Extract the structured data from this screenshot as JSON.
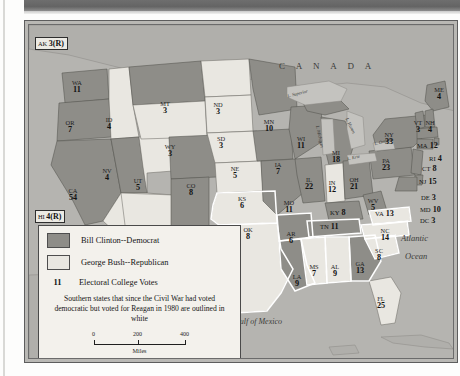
{
  "map": {
    "title": "1992 Presidential Election Electoral College Map",
    "countries": [
      {
        "name": "CANADA",
        "x": 250,
        "y": 38
      },
      {
        "name": "MEXICO",
        "x": 100,
        "y": 300
      }
    ],
    "waters": [
      {
        "name": "Atlantic",
        "x": 378,
        "y": 215
      },
      {
        "name": "Ocean",
        "x": 382,
        "y": 231
      },
      {
        "name": "Gulf of Mexico",
        "x": 238,
        "y": 295
      }
    ],
    "lakes": [
      {
        "name": "L. Superior",
        "x": 281,
        "y": 80
      },
      {
        "name": "L. Michigan",
        "x": 293,
        "y": 118
      },
      {
        "name": "L. Huron",
        "x": 320,
        "y": 108
      },
      {
        "name": "L. Erie",
        "x": 322,
        "y": 139
      },
      {
        "name": "L. Ontario",
        "x": 348,
        "y": 127
      }
    ],
    "insets": [
      {
        "abbr": "AK",
        "votes": "3(R)",
        "x": 10,
        "y": 33
      },
      {
        "abbr": "HI",
        "votes": "4(R)",
        "x": 10,
        "y": 206
      }
    ],
    "states": [
      {
        "abbr": "WA",
        "votes": "11",
        "party": "D",
        "x": 48,
        "y": 60,
        "layout": "stack"
      },
      {
        "abbr": "OR",
        "votes": "7",
        "party": "D",
        "x": 41,
        "y": 100,
        "layout": "stack"
      },
      {
        "abbr": "CA",
        "votes": "54",
        "party": "D",
        "x": 44,
        "y": 168,
        "layout": "stack"
      },
      {
        "abbr": "ID",
        "votes": "4",
        "party": "R",
        "x": 80,
        "y": 97,
        "layout": "stack"
      },
      {
        "abbr": "NV",
        "votes": "4",
        "party": "D",
        "x": 78,
        "y": 148,
        "layout": "stack"
      },
      {
        "abbr": "UT",
        "votes": "5",
        "party": "R",
        "x": 109,
        "y": 158,
        "layout": "stack"
      },
      {
        "abbr": "AZ",
        "votes": "8",
        "party": "R",
        "x": 108,
        "y": 206,
        "layout": "stack"
      },
      {
        "abbr": "MT",
        "votes": "3",
        "party": "D",
        "x": 136,
        "y": 81,
        "layout": "stack"
      },
      {
        "abbr": "WY",
        "votes": "3",
        "party": "R",
        "x": 141,
        "y": 124,
        "layout": "stack"
      },
      {
        "abbr": "CO",
        "votes": "8",
        "party": "D",
        "x": 162,
        "y": 163,
        "layout": "stack"
      },
      {
        "abbr": "NM",
        "votes": "5",
        "party": "D",
        "x": 155,
        "y": 209,
        "layout": "stack"
      },
      {
        "abbr": "ND",
        "votes": "3",
        "party": "R",
        "x": 189,
        "y": 82,
        "layout": "stack"
      },
      {
        "abbr": "SD",
        "votes": "3",
        "party": "R",
        "x": 192,
        "y": 116,
        "layout": "stack"
      },
      {
        "abbr": "NE",
        "votes": "5",
        "party": "R",
        "x": 206,
        "y": 146,
        "layout": "stack"
      },
      {
        "abbr": "KS",
        "votes": "6",
        "party": "R",
        "x": 213,
        "y": 176,
        "layout": "stack"
      },
      {
        "abbr": "OK",
        "votes": "8",
        "party": "R",
        "x": 219,
        "y": 207,
        "layout": "stack"
      },
      {
        "abbr": "TX",
        "votes": "32",
        "party": "R",
        "x": 207,
        "y": 246,
        "layout": "stack"
      },
      {
        "abbr": "MN",
        "votes": "10",
        "party": "D",
        "x": 240,
        "y": 99,
        "layout": "stack"
      },
      {
        "abbr": "IA",
        "votes": "7",
        "party": "D",
        "x": 249,
        "y": 142,
        "layout": "stack"
      },
      {
        "abbr": "MO",
        "votes": "11",
        "party": "D",
        "x": 260,
        "y": 180,
        "layout": "stack"
      },
      {
        "abbr": "AR",
        "votes": "6",
        "party": "D",
        "x": 262,
        "y": 211,
        "layout": "stack"
      },
      {
        "abbr": "LA",
        "votes": "9",
        "party": "D",
        "x": 268,
        "y": 254,
        "layout": "stack"
      },
      {
        "abbr": "MS",
        "votes": "7",
        "party": "R",
        "x": 285,
        "y": 244,
        "layout": "stack"
      },
      {
        "abbr": "AL",
        "votes": "9",
        "party": "R",
        "x": 306,
        "y": 244,
        "layout": "stack"
      },
      {
        "abbr": "GA",
        "votes": "13",
        "party": "D",
        "x": 331,
        "y": 241,
        "layout": "stack"
      },
      {
        "abbr": "FL",
        "votes": "25",
        "party": "R",
        "x": 352,
        "y": 276,
        "layout": "stack"
      },
      {
        "abbr": "WI",
        "votes": "11",
        "party": "D",
        "x": 272,
        "y": 116,
        "layout": "stack"
      },
      {
        "abbr": "IL",
        "votes": "22",
        "party": "D",
        "x": 280,
        "y": 157,
        "layout": "stack"
      },
      {
        "abbr": "MI",
        "votes": "18",
        "party": "D",
        "x": 307,
        "y": 130,
        "layout": "stack"
      },
      {
        "abbr": "IN",
        "votes": "12",
        "party": "R",
        "x": 303,
        "y": 160,
        "layout": "stack"
      },
      {
        "abbr": "OH",
        "votes": "21",
        "party": "D",
        "x": 325,
        "y": 157,
        "layout": "stack"
      },
      {
        "abbr": "KY",
        "votes": "8",
        "party": "D",
        "x": 313,
        "y": 187,
        "layout": "inline"
      },
      {
        "abbr": "TN",
        "votes": "11",
        "party": "D",
        "x": 303,
        "y": 201,
        "layout": "inline"
      },
      {
        "abbr": "WV",
        "votes": "5",
        "party": "D",
        "x": 344,
        "y": 178,
        "layout": "stack"
      },
      {
        "abbr": "VA",
        "votes": "13",
        "party": "R",
        "x": 358,
        "y": 188,
        "layout": "inline"
      },
      {
        "abbr": "NC",
        "votes": "14",
        "party": "R",
        "x": 356,
        "y": 208,
        "layout": "stack"
      },
      {
        "abbr": "SC",
        "votes": "8",
        "party": "R",
        "x": 350,
        "y": 228,
        "layout": "stack"
      },
      {
        "abbr": "PA",
        "votes": "23",
        "party": "D",
        "x": 357,
        "y": 138,
        "layout": "stack"
      },
      {
        "abbr": "NY",
        "votes": "33",
        "party": "D",
        "x": 360,
        "y": 112,
        "layout": "stack"
      },
      {
        "abbr": "ME",
        "votes": "4",
        "party": "D",
        "x": 410,
        "y": 67,
        "layout": "stack"
      },
      {
        "abbr": "VT",
        "votes": "3",
        "party": "D",
        "x": 389,
        "y": 100,
        "layout": "stack"
      },
      {
        "abbr": "NH",
        "votes": "4",
        "party": "D",
        "x": 401,
        "y": 100,
        "layout": "stack"
      },
      {
        "abbr": "MA",
        "votes": "12",
        "party": "D",
        "x": 400,
        "y": 120,
        "layout": "inline"
      },
      {
        "abbr": "RI",
        "votes": "4",
        "party": "D",
        "x": 412,
        "y": 133,
        "layout": "inline"
      },
      {
        "abbr": "CT",
        "votes": "8",
        "party": "D",
        "x": 405,
        "y": 143,
        "layout": "inline"
      },
      {
        "abbr": "NJ",
        "votes": "15",
        "party": "D",
        "x": 402,
        "y": 156,
        "layout": "inline"
      },
      {
        "abbr": "DE",
        "votes": "3",
        "party": "D",
        "x": 404,
        "y": 172,
        "layout": "inline"
      },
      {
        "abbr": "MD",
        "votes": "10",
        "party": "D",
        "x": 403,
        "y": 184,
        "layout": "inline"
      },
      {
        "abbr": "DC",
        "votes": "3",
        "party": "D",
        "x": 403,
        "y": 195,
        "layout": "inline"
      }
    ]
  },
  "legend": {
    "democrat_label": "Bill Clinton--Democrat",
    "republican_label": "George Bush--Republican",
    "votes_sample": "11",
    "votes_label": "Electoral College Votes",
    "note": "Southern states that since the Civil War had voted democratic but voted for Reagan in 1980 are outlined in white",
    "colors": {
      "democrat": "#8e8d88",
      "republican": "#e9e7e1",
      "water": "#b5b4b0",
      "outline": "#4a4a4a"
    },
    "scale": {
      "ticks": [
        "0",
        "200",
        "400"
      ],
      "unit": "Miles"
    }
  }
}
